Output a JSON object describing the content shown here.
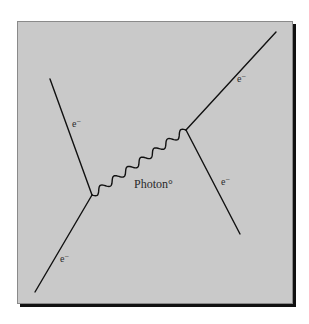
{
  "diagram": {
    "type": "feynman",
    "background_color": "#c9c9c9",
    "line_color": "#111111",
    "vertices": [
      {
        "id": "left",
        "x": 92,
        "y": 195
      },
      {
        "id": "right",
        "x": 186,
        "y": 130
      }
    ],
    "fermion_lines": [
      {
        "id": "incoming-top-left",
        "from": [
          50,
          79
        ],
        "to": [
          92,
          195
        ],
        "label": "e",
        "charge": "−"
      },
      {
        "id": "incoming-bottom-left",
        "from": [
          35,
          292
        ],
        "to": [
          92,
          195
        ],
        "label": "e",
        "charge": "−"
      },
      {
        "id": "outgoing-top-right",
        "from": [
          186,
          130
        ],
        "to": [
          276,
          32
        ],
        "label": "e",
        "charge": "−"
      },
      {
        "id": "outgoing-bottom-right",
        "from": [
          186,
          130
        ],
        "to": [
          240,
          234
        ],
        "label": "e",
        "charge": "−"
      }
    ],
    "photon": {
      "from": [
        92,
        195
      ],
      "to": [
        186,
        130
      ],
      "label": "Photon°"
    },
    "labels": {
      "top_left_e": "e",
      "top_left_charge": "−",
      "bottom_left_e": "e",
      "bottom_left_charge": "−",
      "top_right_e": "e",
      "top_right_charge": "−",
      "bottom_right_e": "e",
      "bottom_right_charge": "−",
      "photon": "Photon°"
    }
  }
}
